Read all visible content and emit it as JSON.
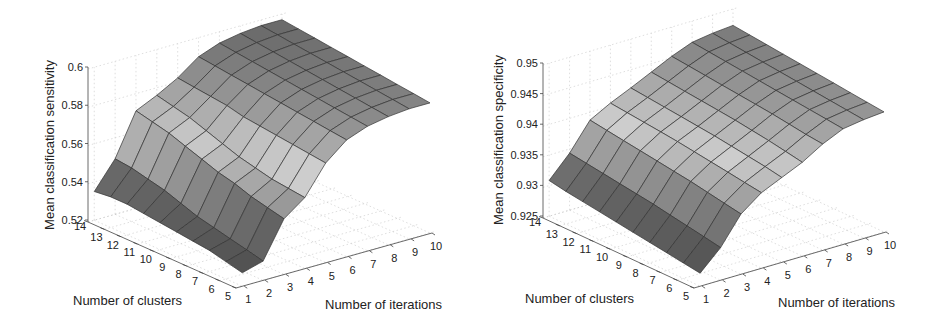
{
  "chart_data": [
    {
      "type": "surface",
      "title": "",
      "xlabel": "Number of clusters",
      "ylabel": "Number of iterations",
      "zlabel": "Mean classification sensitivity",
      "x_ticks": [
        5,
        6,
        7,
        8,
        9,
        10,
        11,
        12,
        13,
        14
      ],
      "y_ticks": [
        1,
        2,
        3,
        4,
        5,
        6,
        7,
        8,
        9,
        10
      ],
      "z_ticks": [
        "0.52",
        "0.54",
        "0.56",
        "0.58",
        "0.6"
      ],
      "zlim": [
        0.52,
        0.6
      ],
      "grid": true,
      "colormap": "gray",
      "clusters": [
        5,
        6,
        7,
        8,
        9,
        10,
        11,
        12,
        13,
        14
      ],
      "iterations": [
        1,
        2,
        3,
        4,
        5,
        6,
        7,
        8,
        9,
        10
      ],
      "z": [
        [
          0.526,
          0.529,
          0.548,
          0.556,
          0.571,
          0.58,
          0.584,
          0.586,
          0.587,
          0.587
        ],
        [
          0.528,
          0.531,
          0.55,
          0.557,
          0.572,
          0.581,
          0.585,
          0.587,
          0.588,
          0.588
        ],
        [
          0.53,
          0.533,
          0.552,
          0.558,
          0.573,
          0.582,
          0.586,
          0.588,
          0.589,
          0.589
        ],
        [
          0.531,
          0.535,
          0.555,
          0.56,
          0.574,
          0.583,
          0.587,
          0.589,
          0.59,
          0.59
        ],
        [
          0.532,
          0.537,
          0.557,
          0.562,
          0.575,
          0.584,
          0.588,
          0.59,
          0.591,
          0.591
        ],
        [
          0.533,
          0.54,
          0.56,
          0.565,
          0.576,
          0.585,
          0.589,
          0.591,
          0.592,
          0.592
        ],
        [
          0.534,
          0.543,
          0.563,
          0.568,
          0.578,
          0.586,
          0.59,
          0.592,
          0.593,
          0.593
        ],
        [
          0.535,
          0.545,
          0.566,
          0.571,
          0.579,
          0.587,
          0.591,
          0.593,
          0.594,
          0.594
        ],
        [
          0.535,
          0.547,
          0.568,
          0.573,
          0.58,
          0.588,
          0.592,
          0.594,
          0.595,
          0.595
        ],
        [
          0.534,
          0.548,
          0.57,
          0.575,
          0.581,
          0.589,
          0.593,
          0.595,
          0.596,
          0.596
        ]
      ]
    },
    {
      "type": "surface",
      "title": "",
      "xlabel": "Number of clusters",
      "ylabel": "Number of iterations",
      "zlabel": "Mean classification specificity",
      "x_ticks": [
        5,
        6,
        7,
        8,
        9,
        10,
        11,
        12,
        13,
        14
      ],
      "y_ticks": [
        1,
        2,
        3,
        4,
        5,
        6,
        7,
        8,
        9,
        10
      ],
      "z_ticks": [
        "0.925",
        "0.93",
        "0.935",
        "0.94",
        "0.945",
        "0.95"
      ],
      "zlim": [
        0.925,
        0.95
      ],
      "grid": true,
      "colormap": "gray",
      "clusters": [
        5,
        6,
        7,
        8,
        9,
        10,
        11,
        12,
        13,
        14
      ],
      "iterations": [
        1,
        2,
        3,
        4,
        5,
        6,
        7,
        8,
        9,
        10
      ],
      "z": [
        [
          0.9268,
          0.93,
          0.9345,
          0.937,
          0.9385,
          0.94,
          0.942,
          0.9435,
          0.944,
          0.9443
        ],
        [
          0.9272,
          0.9305,
          0.935,
          0.9374,
          0.939,
          0.9405,
          0.9423,
          0.9438,
          0.9443,
          0.9446
        ],
        [
          0.9276,
          0.931,
          0.9355,
          0.9378,
          0.9394,
          0.941,
          0.9427,
          0.9441,
          0.9446,
          0.9449
        ],
        [
          0.928,
          0.9315,
          0.936,
          0.9382,
          0.9398,
          0.9414,
          0.9431,
          0.9444,
          0.9449,
          0.9452
        ],
        [
          0.9284,
          0.932,
          0.9364,
          0.9386,
          0.9402,
          0.9418,
          0.9434,
          0.9447,
          0.9452,
          0.9455
        ],
        [
          0.9288,
          0.9324,
          0.9368,
          0.939,
          0.9405,
          0.9421,
          0.9437,
          0.945,
          0.9455,
          0.9458
        ],
        [
          0.9292,
          0.9328,
          0.9372,
          0.9393,
          0.9408,
          0.9424,
          0.944,
          0.9453,
          0.9458,
          0.9461
        ],
        [
          0.9296,
          0.9332,
          0.9376,
          0.9396,
          0.9411,
          0.9427,
          0.9443,
          0.9456,
          0.9461,
          0.9464
        ],
        [
          0.93,
          0.9336,
          0.938,
          0.9399,
          0.9414,
          0.943,
          0.9446,
          0.9459,
          0.9464,
          0.9467
        ],
        [
          0.9305,
          0.934,
          0.9384,
          0.9402,
          0.9417,
          0.9433,
          0.9449,
          0.9462,
          0.9467,
          0.947
        ]
      ]
    }
  ],
  "geometry": [
    {
      "origin_z_axis_x": 88,
      "z_top_y": 67,
      "z_bottom_y": 220,
      "cluster_axis": {
        "start": [
          88,
          222
        ],
        "end": [
          236,
          288
        ]
      },
      "iter_axis": {
        "start": [
          238,
          288
        ],
        "end": [
          432,
          233
        ]
      },
      "xlabel_pos": [
        73,
        305
      ],
      "ylabel_pos": [
        325,
        309
      ],
      "zlabel_pos": [
        54,
        145
      ]
    },
    {
      "origin_z_axis_x": 70,
      "z_top_y": 63,
      "z_bottom_y": 216,
      "cluster_axis": {
        "start": [
          70,
          218
        ],
        "end": [
          221,
          288
        ]
      },
      "iter_axis": {
        "start": [
          223,
          288
        ],
        "end": [
          413,
          232
        ]
      },
      "xlabel_pos": [
        52,
        303
      ],
      "ylabel_pos": [
        305,
        307
      ],
      "zlabel_pos": [
        30,
        140
      ]
    }
  ]
}
